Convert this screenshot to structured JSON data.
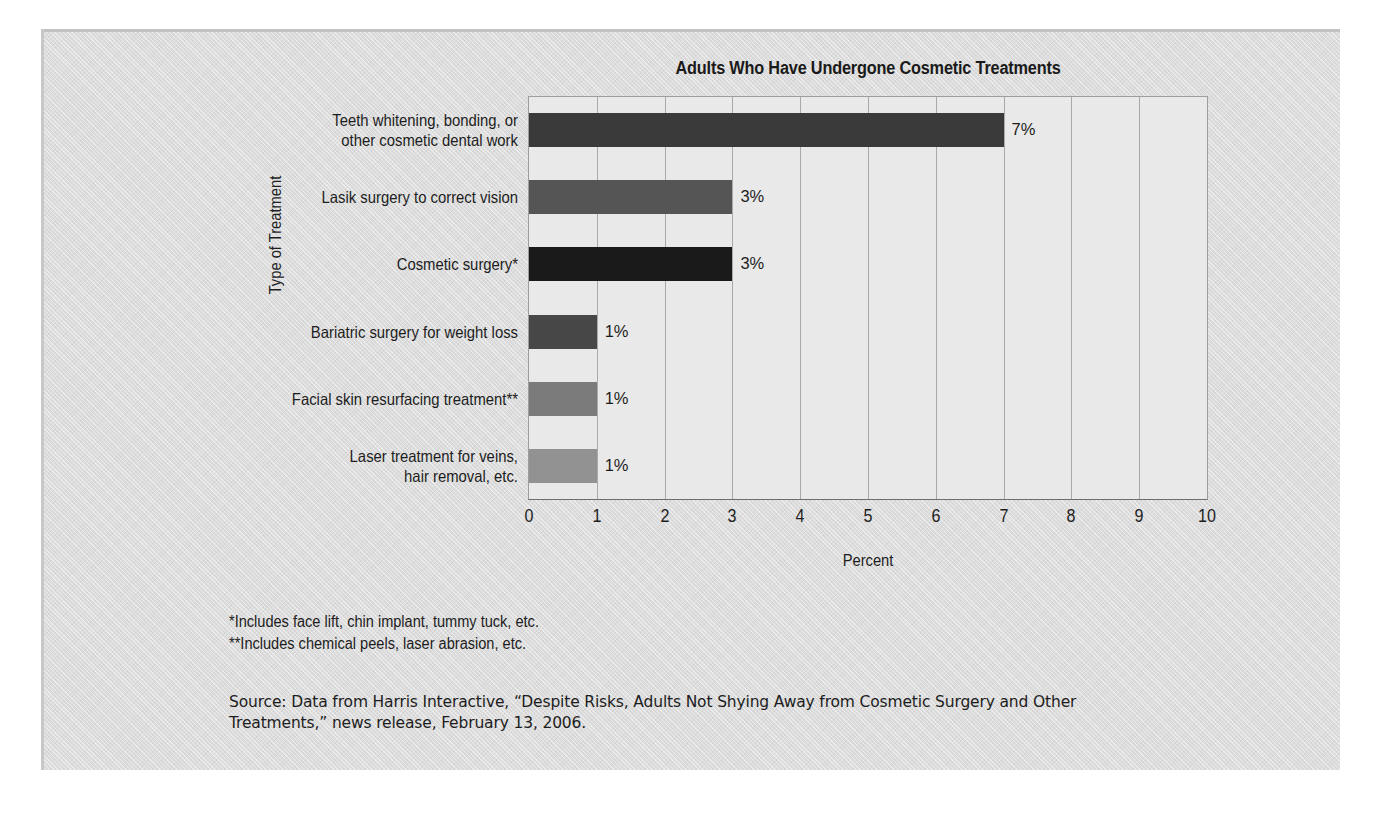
{
  "chart_data": {
    "type": "bar",
    "orientation": "horizontal",
    "title": "Adults Who Have Undergone Cosmetic Treatments",
    "xlabel": "Percent",
    "ylabel": "Type of Treatment",
    "xlim": [
      0,
      10
    ],
    "xticks": [
      "0",
      "1",
      "2",
      "3",
      "4",
      "5",
      "6",
      "7",
      "8",
      "9",
      "10"
    ],
    "grid": "vertical",
    "legend": "none",
    "categories": [
      "Teeth whitening, bonding, or\nother cosmetic dental work",
      "Lasik surgery to correct vision",
      "Cosmetic surgery*",
      "Bariatric surgery for weight loss",
      "Facial skin resurfacing treatment**",
      "Laser treatment for veins,\nhair removal, etc."
    ],
    "values": [
      7,
      3,
      3,
      1,
      1,
      1
    ],
    "value_labels": [
      "7%",
      "3%",
      "3%",
      "1%",
      "1%",
      "1%"
    ],
    "bar_colors": [
      "#3a3a3a",
      "#555555",
      "#1a1a1a",
      "#474747",
      "#7b7b7b",
      "#929292"
    ]
  },
  "categories": [
    {
      "line1": "Teeth whitening, bonding, or",
      "line2": "other cosmetic dental work"
    },
    {
      "line1": "Lasik surgery to correct vision",
      "line2": ""
    },
    {
      "line1": "Cosmetic surgery*",
      "line2": ""
    },
    {
      "line1": "Bariatric surgery for weight loss",
      "line2": ""
    },
    {
      "line1": "Facial skin resurfacing treatment**",
      "line2": ""
    },
    {
      "line1": "Laser treatment for veins,",
      "line2": "hair removal, etc."
    }
  ],
  "footnotes": [
    "*Includes face lift, chin implant, tummy tuck, etc.",
    "**Includes chemical peels, laser abrasion, etc."
  ],
  "source": {
    "line1": "Source: Data from Harris Interactive, “Despite Risks, Adults Not Shying Away from Cosmetic Surgery and Other",
    "line2": "Treatments,” news release, February 13, 2006."
  },
  "colors": {
    "panel_background": "#dcdcdc",
    "plot_background": "#e9e9e9",
    "gridline": "#a9a9a9",
    "axis": "#6d6d6d",
    "text": "#1d1d1d"
  }
}
